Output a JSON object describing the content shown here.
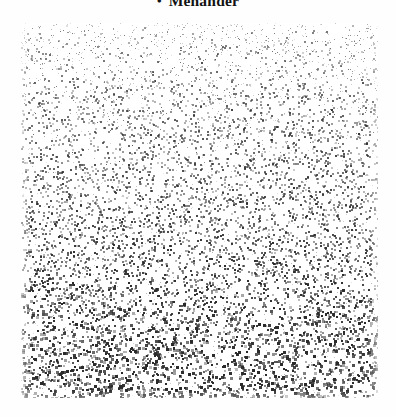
{
  "page": {
    "background_color": "#fefefe",
    "width": 396,
    "height": 417
  },
  "heading": {
    "bullet": "•",
    "text": "Menander",
    "color": "#121212",
    "clipped": "true"
  },
  "plate": {
    "label": "halftone-stipple-image",
    "x": 21,
    "y": 23,
    "width": 357,
    "height": 375,
    "dot_color": "#2b2b2b",
    "background_color": "#ffffff",
    "dot_count": 9200,
    "dot_min_size": 1,
    "dot_max_size": 3,
    "density_top": 0.62,
    "density_bottom": 1.0,
    "darkness_top": 0.5,
    "darkness_bottom": 0.95
  }
}
